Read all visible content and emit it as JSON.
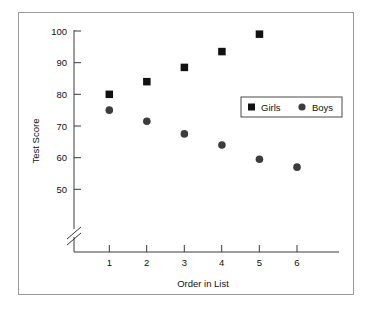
{
  "chart_data": {
    "type": "scatter",
    "title": "",
    "xlabel": "Order in List",
    "ylabel": "Test Score",
    "x": [
      1,
      2,
      3,
      4,
      5,
      6
    ],
    "xlim": [
      0,
      7
    ],
    "ylim": [
      47,
      100
    ],
    "y_axis_break": true,
    "grid": false,
    "legend_position": "inside-right",
    "xticks": [
      "1",
      "2",
      "3",
      "4",
      "5",
      "6"
    ],
    "yticks": [
      "50",
      "60",
      "70",
      "80",
      "90",
      "100"
    ],
    "series": [
      {
        "name": "Girls",
        "marker": "square",
        "color": "#111111",
        "x": [
          1,
          2,
          3,
          4,
          5
        ],
        "values": [
          80,
          84,
          88.5,
          93.5,
          99
        ]
      },
      {
        "name": "Boys",
        "marker": "circle",
        "color": "#3c3c3c",
        "x": [
          1,
          2,
          3,
          4,
          5,
          6
        ],
        "values": [
          75,
          71.5,
          67.5,
          64,
          59.5,
          57
        ]
      }
    ]
  },
  "legend": {
    "entries": [
      {
        "label": "Girls",
        "marker": "square"
      },
      {
        "label": "Boys",
        "marker": "circle"
      }
    ]
  },
  "axes": {
    "y_title": "Test Score",
    "x_title": "Order in List",
    "y_tick_labels": [
      "100",
      "90",
      "80",
      "70",
      "60",
      "50"
    ],
    "x_tick_labels": [
      "1",
      "2",
      "3",
      "4",
      "5",
      "6"
    ]
  },
  "colors": {
    "girls_marker": "#111111",
    "boys_marker": "#3c3c3c",
    "axis": "#3a3a3a",
    "frame": "#9a9a9a",
    "background": "#ffffff"
  }
}
